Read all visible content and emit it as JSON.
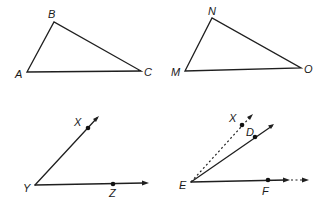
{
  "figures": {
    "triangle_abc": {
      "labels": {
        "A": "A",
        "B": "B",
        "C": "C"
      },
      "vertices": {
        "A": [
          27,
          72
        ],
        "B": [
          54,
          22
        ],
        "C": [
          141,
          71
        ]
      }
    },
    "triangle_mno": {
      "labels": {
        "M": "M",
        "N": "N",
        "O": "O"
      },
      "vertices": {
        "M": [
          185,
          71
        ],
        "N": [
          212,
          18
        ],
        "O": [
          301,
          68
        ]
      }
    },
    "angle_xyz": {
      "labels": {
        "X": "X",
        "Y": "Y",
        "Z": "Z"
      },
      "vertex": [
        35,
        185
      ],
      "points": {
        "X": [
          88,
          128
        ],
        "Z": [
          113,
          184
        ]
      }
    },
    "angle_def": {
      "labels": {
        "X": "X",
        "D": "D",
        "E": "E",
        "F": "F"
      },
      "vertex": [
        191,
        182
      ],
      "points": {
        "X": [
          242,
          125
        ],
        "D": [
          255,
          137
        ],
        "F": [
          268,
          180
        ]
      },
      "notes": "ray EX is dashed; ray EF has dotted continuation"
    }
  },
  "colors": {
    "stroke": "#1f1f1f",
    "background": "#ffffff"
  }
}
